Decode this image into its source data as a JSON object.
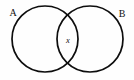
{
  "figure": {
    "type": "venn-diagram",
    "width": 134,
    "height": 80,
    "background_color": "#fefefe",
    "stroke_color": "#0d0d0d",
    "stroke_width": 1.7,
    "has_outer_border": false
  },
  "sets": [
    {
      "id": "set-a",
      "label": "A",
      "label_x": 13,
      "label_y": 16,
      "center_x": 45,
      "center_y": 39,
      "radius": 33
    },
    {
      "id": "set-b",
      "label": "B",
      "label_x": 118,
      "label_y": 17,
      "center_x": 90,
      "center_y": 39,
      "radius": 33
    }
  ],
  "elements": [
    {
      "id": "element-x",
      "label": "x",
      "region": "intersection",
      "x": 68,
      "y": 43
    }
  ],
  "intersection_points": [
    {
      "x": 67.5,
      "y": 7
    },
    {
      "x": 67.5,
      "y": 71
    }
  ]
}
